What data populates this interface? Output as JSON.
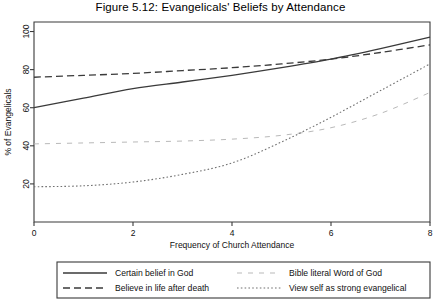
{
  "figure": {
    "title": "Figure 5.12: Evangelicals' Beliefs by Attendance",
    "background": "#ffffff"
  },
  "axes": {
    "x": {
      "label": "Frequency of Church Attendance",
      "ticks": [
        "0",
        "2",
        "4",
        "6",
        "8"
      ],
      "tick_values": [
        0,
        2,
        4,
        6,
        8
      ],
      "min": 0,
      "max": 8
    },
    "y": {
      "label": "% of Evangelicals",
      "ticks": [
        "20",
        "40",
        "60",
        "80",
        "100"
      ],
      "tick_values": [
        20,
        40,
        60,
        80,
        100
      ],
      "min": 0,
      "max": 105
    }
  },
  "legend": {
    "entries": [
      {
        "label": "Certain belief in God",
        "style": "solid",
        "color": "#3a3a3a"
      },
      {
        "label": "Believe in life after death",
        "style": "dashed",
        "color": "#3a3a3a"
      },
      {
        "label": "Bible literal Word of God",
        "style": "sparse-dash",
        "color": "#b9b9b9"
      },
      {
        "label": "View self as strong evangelical",
        "style": "dotted",
        "color": "#707070"
      }
    ]
  },
  "chart_data": {
    "type": "line",
    "title": "Figure 5.12: Evangelicals' Beliefs by Attendance",
    "xlabel": "Frequency of Church Attendance",
    "ylabel": "% of Evangelicals",
    "xlim": [
      0,
      8
    ],
    "ylim": [
      0,
      105
    ],
    "xticks": [
      0,
      2,
      4,
      6,
      8
    ],
    "yticks": [
      20,
      40,
      60,
      80,
      100
    ],
    "grid": false,
    "legend_position": "below-plot",
    "x": [
      0,
      1,
      2,
      3,
      4,
      5,
      6,
      7,
      8
    ],
    "series": [
      {
        "name": "Certain belief in God",
        "style": "solid",
        "color": "#3a3a3a",
        "values": [
          60,
          65,
          70,
          73.5,
          77,
          81,
          85.5,
          91,
          97
        ]
      },
      {
        "name": "Believe in life after death",
        "style": "dashed",
        "color": "#3a3a3a",
        "values": [
          76,
          77,
          78,
          79.5,
          81,
          83,
          85.5,
          89,
          93
        ]
      },
      {
        "name": "Bible literal Word of God",
        "style": "sparse-dash",
        "color": "#b9b9b9",
        "values": [
          41,
          41.5,
          42,
          42.5,
          43.5,
          45.5,
          49.5,
          57,
          68
        ]
      },
      {
        "name": "View self as strong evangelical",
        "style": "dotted",
        "color": "#707070",
        "values": [
          18.5,
          19,
          21,
          25,
          31,
          42,
          55,
          69,
          83
        ]
      }
    ]
  }
}
